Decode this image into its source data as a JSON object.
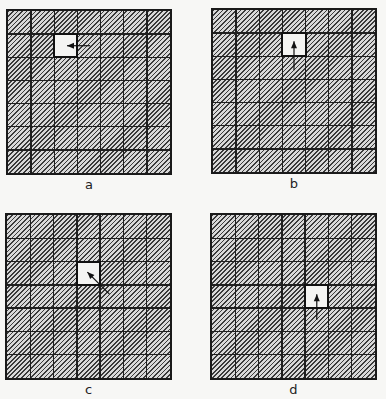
{
  "figure": {
    "grid_size": 7,
    "panels": [
      {
        "id": "a",
        "label": "a",
        "box": {
          "left": 6,
          "top": 9,
          "size": 166
        },
        "open_cell": {
          "row": 1,
          "col": 2
        },
        "arrow": {
          "direction": "left",
          "from": [
            1.55,
            0.5
          ],
          "to": [
            0.55,
            0.5
          ]
        }
      },
      {
        "id": "b",
        "label": "b",
        "box": {
          "left": 211,
          "top": 8,
          "size": 166
        },
        "open_cell": {
          "row": 1,
          "col": 3
        },
        "arrow": {
          "direction": "up",
          "from": [
            0.5,
            1.6
          ],
          "to": [
            0.5,
            0.35
          ]
        }
      },
      {
        "id": "c",
        "label": "c",
        "box": {
          "left": 5,
          "top": 213,
          "size": 167
        },
        "open_cell": {
          "row": 2,
          "col": 3
        },
        "arrow": {
          "direction": "up-left",
          "from": [
            1.4,
            1.4
          ],
          "to": [
            0.45,
            0.45
          ]
        }
      },
      {
        "id": "d",
        "label": "d",
        "box": {
          "left": 210,
          "top": 213,
          "size": 167
        },
        "open_cell": {
          "row": 3,
          "col": 4
        },
        "arrow": {
          "direction": "up",
          "from": [
            0.5,
            1.5
          ],
          "to": [
            0.5,
            0.4
          ]
        }
      }
    ],
    "colors": {
      "grid_line": "#1f1f1f",
      "hatch_dark": "#3a3a3a",
      "hatch_light": "#d8d8d8",
      "open_cell": "#f4f4f2",
      "background": "#f7f7f5"
    }
  }
}
